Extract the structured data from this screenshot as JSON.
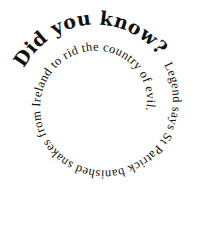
{
  "spiral": {
    "heading": "Did you know?",
    "body": "Legend says St Patrick banished snakes from Ireland to rid the country of evil."
  },
  "colors": {
    "background": "#ffffff",
    "text": "#111111"
  }
}
